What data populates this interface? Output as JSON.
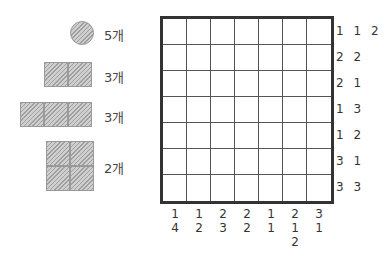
{
  "pieces": [
    {
      "shape": "circle-1",
      "count_label": "5개"
    },
    {
      "shape": "domino-1x2",
      "count_label": "3개"
    },
    {
      "shape": "tromino-1x3",
      "count_label": "3개"
    },
    {
      "shape": "square-2x2",
      "count_label": "2개"
    }
  ],
  "grid": {
    "rows": 7,
    "cols": 7,
    "row_clues": [
      "1 1 2",
      "2 2",
      "2 1",
      "1 3",
      "1 2",
      "3 1",
      "3 3"
    ],
    "col_clues": [
      [
        "1",
        "4"
      ],
      [
        "1",
        "2"
      ],
      [
        "2",
        "3"
      ],
      [
        "2",
        "2"
      ],
      [
        "1",
        "1"
      ],
      [
        "2",
        "1",
        "2"
      ],
      [
        "3",
        "1"
      ]
    ]
  }
}
